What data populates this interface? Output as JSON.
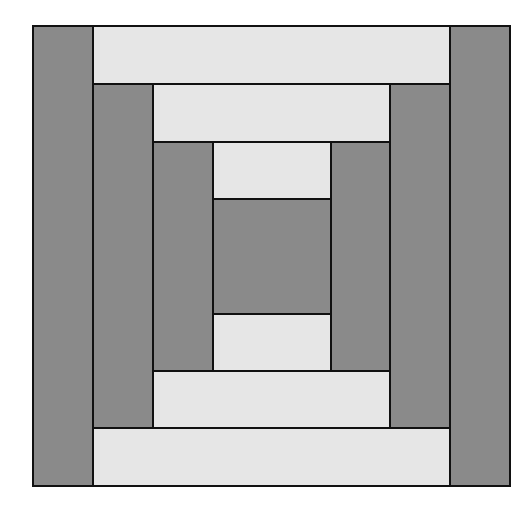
{
  "diagram": {
    "colors": {
      "dark": "#8a8a8a",
      "light": "#e6e6e6",
      "outline": "#111111"
    },
    "pieces": [
      {
        "id": "outer-left",
        "tone": "dark",
        "x": 32,
        "y": 25,
        "w": 62,
        "h": 462
      },
      {
        "id": "outer-right",
        "tone": "dark",
        "x": 449,
        "y": 25,
        "w": 62,
        "h": 462
      },
      {
        "id": "outer-top",
        "tone": "light",
        "x": 92,
        "y": 25,
        "w": 359,
        "h": 60
      },
      {
        "id": "outer-bottom",
        "tone": "light",
        "x": 92,
        "y": 427,
        "w": 359,
        "h": 60
      },
      {
        "id": "mid-left",
        "tone": "dark",
        "x": 92,
        "y": 83,
        "w": 62,
        "h": 346
      },
      {
        "id": "mid-right",
        "tone": "dark",
        "x": 389,
        "y": 83,
        "w": 62,
        "h": 346
      },
      {
        "id": "mid-top",
        "tone": "light",
        "x": 152,
        "y": 83,
        "w": 239,
        "h": 60
      },
      {
        "id": "mid-bottom",
        "tone": "light",
        "x": 152,
        "y": 370,
        "w": 239,
        "h": 59
      },
      {
        "id": "inner-left",
        "tone": "dark",
        "x": 152,
        "y": 141,
        "w": 62,
        "h": 231
      },
      {
        "id": "inner-right",
        "tone": "dark",
        "x": 330,
        "y": 141,
        "w": 61,
        "h": 231
      },
      {
        "id": "inner-top",
        "tone": "light",
        "x": 212,
        "y": 141,
        "w": 120,
        "h": 59
      },
      {
        "id": "inner-bottom",
        "tone": "light",
        "x": 212,
        "y": 313,
        "w": 120,
        "h": 59
      },
      {
        "id": "center",
        "tone": "dark",
        "x": 212,
        "y": 198,
        "w": 120,
        "h": 117
      }
    ]
  }
}
